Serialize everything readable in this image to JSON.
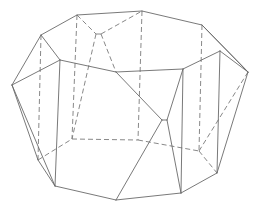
{
  "figure": {
    "type": "polyhedron-line-drawing",
    "stroke_color": "#6a6a6a",
    "hidden_stroke_color": "#7a7a7a",
    "solid_edges": [
      [
        [
          12,
          85
        ],
        [
          41,
          35
        ]
      ],
      [
        [
          41,
          35
        ],
        [
          77,
          15
        ]
      ],
      [
        [
          77,
          15
        ],
        [
          142,
          11
        ]
      ],
      [
        [
          142,
          11
        ],
        [
          202,
          25
        ]
      ],
      [
        [
          202,
          25
        ],
        [
          248,
          72
        ]
      ],
      [
        [
          12,
          85
        ],
        [
          60,
          60
        ]
      ],
      [
        [
          41,
          35
        ],
        [
          60,
          60
        ]
      ],
      [
        [
          60,
          60
        ],
        [
          116,
          72
        ]
      ],
      [
        [
          116,
          72
        ],
        [
          183,
          69
        ]
      ],
      [
        [
          183,
          69
        ],
        [
          220,
          51
        ]
      ],
      [
        [
          220,
          51
        ],
        [
          248,
          72
        ]
      ],
      [
        [
          202,
          25
        ],
        [
          248,
          72
        ]
      ],
      [
        [
          12,
          85
        ],
        [
          55,
          186
        ]
      ],
      [
        [
          12,
          85
        ],
        [
          38,
          160
        ]
      ],
      [
        [
          38,
          160
        ],
        [
          55,
          186
        ]
      ],
      [
        [
          55,
          186
        ],
        [
          116,
          200
        ]
      ],
      [
        [
          116,
          200
        ],
        [
          181,
          193
        ]
      ],
      [
        [
          181,
          193
        ],
        [
          217,
          173
        ]
      ],
      [
        [
          217,
          173
        ],
        [
          248,
          72
        ]
      ],
      [
        [
          60,
          60
        ],
        [
          55,
          186
        ]
      ],
      [
        [
          183,
          69
        ],
        [
          181,
          193
        ]
      ],
      [
        [
          220,
          51
        ],
        [
          217,
          173
        ]
      ],
      [
        [
          116,
          72
        ],
        [
          162,
          120
        ]
      ],
      [
        [
          162,
          120
        ],
        [
          167,
          120
        ]
      ],
      [
        [
          167,
          120
        ],
        [
          183,
          69
        ]
      ],
      [
        [
          162,
          120
        ],
        [
          116,
          200
        ]
      ],
      [
        [
          167,
          120
        ],
        [
          181,
          193
        ]
      ]
    ],
    "hidden_edges": [
      [
        [
          77,
          15
        ],
        [
          96,
          34
        ]
      ],
      [
        [
          96,
          34
        ],
        [
          101,
          34
        ]
      ],
      [
        [
          101,
          34
        ],
        [
          142,
          11
        ]
      ],
      [
        [
          41,
          35
        ],
        [
          38,
          160
        ]
      ],
      [
        [
          77,
          15
        ],
        [
          72,
          139
        ]
      ],
      [
        [
          142,
          11
        ],
        [
          138,
          140
        ]
      ],
      [
        [
          202,
          25
        ],
        [
          199,
          151
        ]
      ],
      [
        [
          96,
          34
        ],
        [
          72,
          139
        ]
      ],
      [
        [
          101,
          34
        ],
        [
          116,
          72
        ]
      ],
      [
        [
          38,
          160
        ],
        [
          72,
          139
        ]
      ],
      [
        [
          72,
          139
        ],
        [
          138,
          140
        ]
      ],
      [
        [
          138,
          140
        ],
        [
          199,
          151
        ]
      ],
      [
        [
          199,
          151
        ],
        [
          248,
          72
        ]
      ],
      [
        [
          199,
          151
        ],
        [
          217,
          173
        ]
      ]
    ]
  }
}
